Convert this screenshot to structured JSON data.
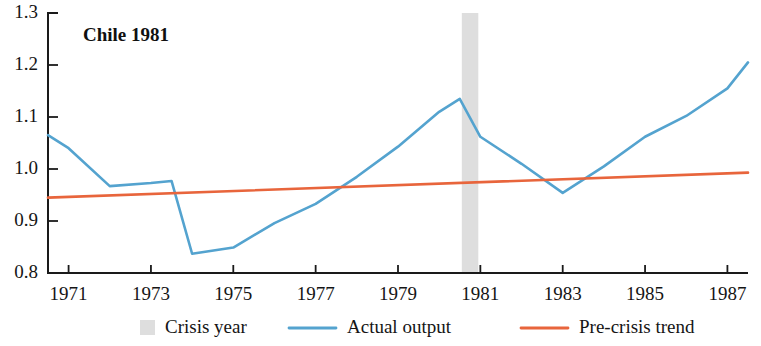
{
  "chart_data": {
    "type": "line",
    "title": "Chile 1981",
    "xlabel": "",
    "ylabel": "",
    "xlim": [
      1970.5,
      1987.5
    ],
    "ylim": [
      0.8,
      1.3
    ],
    "grid": false,
    "legend_position": "bottom",
    "y_ticks": [
      "1.3",
      "1.2",
      "1.1",
      "1.0",
      "0.9",
      "0.8"
    ],
    "y_tick_values": [
      1.3,
      1.2,
      1.1,
      1.0,
      0.9,
      0.8
    ],
    "x_ticks": [
      "1971",
      "1973",
      "1975",
      "1977",
      "1979",
      "1981",
      "1983",
      "1985",
      "1987"
    ],
    "x_tick_values": [
      1971,
      1973,
      1975,
      1977,
      1979,
      1981,
      1983,
      1985,
      1987
    ],
    "crisis_year": 1981,
    "crisis_band": {
      "start": 1980.55,
      "end": 1980.95,
      "color": "#dedede"
    },
    "series": [
      {
        "name": "Actual output",
        "color": "#54a3cf",
        "x": [
          1970.5,
          1971.0,
          1972.0,
          1973.0,
          1973.5,
          1974.0,
          1975.0,
          1976.0,
          1977.0,
          1978.0,
          1979.0,
          1980.0,
          1980.5,
          1981.0,
          1982.0,
          1983.0,
          1984.0,
          1985.0,
          1986.0,
          1987.0,
          1987.5
        ],
        "values": [
          1.065,
          1.04,
          0.967,
          0.973,
          0.977,
          0.837,
          0.849,
          0.896,
          0.933,
          0.985,
          1.043,
          1.11,
          1.135,
          1.062,
          1.01,
          0.954,
          1.005,
          1.062,
          1.102,
          1.155,
          1.205
        ]
      },
      {
        "name": "Pre-crisis trend",
        "color": "#e8653c",
        "x": [
          1970.5,
          1987.5
        ],
        "values": [
          0.945,
          0.993
        ]
      }
    ],
    "legend": [
      {
        "label": "Crisis year",
        "marker": "swatch",
        "color": "#dedede"
      },
      {
        "label": "Actual output",
        "marker": "line",
        "color": "#54a3cf"
      },
      {
        "label": "Pre-crisis trend",
        "marker": "line",
        "color": "#e8653c"
      }
    ]
  }
}
